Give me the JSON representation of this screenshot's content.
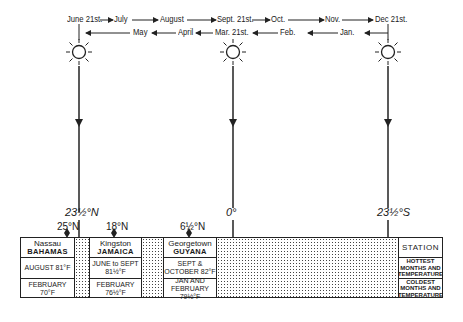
{
  "top_months_forward": [
    "June 21st.",
    "July",
    "August",
    "Sept. 21st.",
    "Oct.",
    "Nov.",
    "Dec 21st."
  ],
  "bottom_months_backward": [
    "May",
    "April",
    "Mar. 21st.",
    "Feb.",
    "Jan."
  ],
  "latitudes": {
    "tropic_cancer": "23½°N",
    "equator": "0°",
    "tropic_capricorn": "23½°S"
  },
  "station_markers": [
    "25°N",
    "18°N",
    "6½°N"
  ],
  "stations": [
    {
      "name": "Nassau",
      "country": "BAHAMAS",
      "hottest": "AUGUST 81°F",
      "coldest": "FEBRUARY 70°F"
    },
    {
      "name": "Kingston",
      "country": "JAMAICA",
      "hottest": "JUNE to SEPT 81½°F",
      "coldest": "FEBRUARY 76½°F"
    },
    {
      "name": "Georgetown",
      "country": "GUYANA",
      "hottest": "SEPT & OCTOBER 82°F",
      "coldest": "JAN AND FEBRUARY 79½°F"
    }
  ],
  "legend": {
    "station": "STATION",
    "hottest": "HOTTEST MONTHS AND TEMPERATURE",
    "coldest": "COLDEST MONTHS AND TEMPERATURE"
  },
  "icons": {
    "sun": "sun-icon"
  }
}
